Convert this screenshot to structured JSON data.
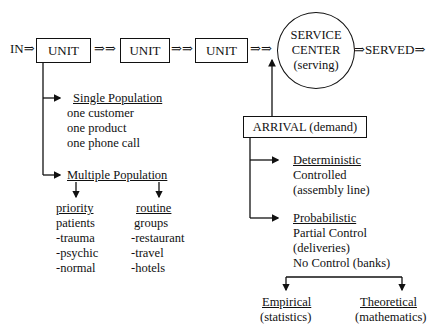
{
  "flow": {
    "input_label": "IN⇒",
    "units": [
      "UNIT",
      "UNIT",
      "UNIT"
    ],
    "connector": "⇒⇒",
    "service_center": {
      "line1": "SERVICE",
      "line2": "CENTER",
      "line3": "(serving)"
    },
    "output_label": "⇒SERVED⇒"
  },
  "population": {
    "single": {
      "title": "Single Population",
      "items": [
        "one customer",
        "one product",
        "one phone call"
      ]
    },
    "multiple": {
      "title": "Multiple Population",
      "priority": {
        "title": "priority",
        "items": [
          "patients",
          "-trauma",
          "-psychic",
          "-normal"
        ]
      },
      "routine": {
        "title": "routine",
        "items": [
          "groups",
          "-restaurant",
          "-travel",
          "-hotels"
        ]
      }
    }
  },
  "arrival": {
    "label": "ARRIVAL (demand)",
    "deterministic": {
      "title": "Deterministic",
      "items": [
        "Controlled",
        "(assembly line)"
      ]
    },
    "probabilistic": {
      "title": "Probabilistic",
      "items": [
        "Partial Control",
        "(deliveries)",
        "No Control (banks)"
      ]
    },
    "empirical": {
      "title": "Empirical",
      "subtitle": "(statistics)"
    },
    "theoretical": {
      "title": "Theoretical",
      "subtitle": "(mathematics)"
    }
  },
  "colors": {
    "ink": "#111111",
    "background": "#ffffff"
  }
}
